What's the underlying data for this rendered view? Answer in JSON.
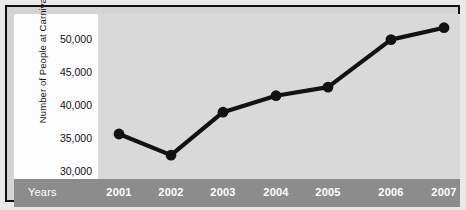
{
  "chart_data": {
    "type": "line",
    "title": "",
    "xlabel": "Years",
    "ylabel": "Number of People at Carnival",
    "categories": [
      "2001",
      "2002",
      "2003",
      "2004",
      "2005",
      "2006",
      "2007"
    ],
    "values": [
      34700,
      31500,
      38000,
      40500,
      41800,
      49000,
      50800
    ],
    "series": [
      {
        "name": "Number of People at Carnival",
        "values": [
          34700,
          31500,
          38000,
          40500,
          41800,
          49000,
          50800
        ]
      }
    ],
    "ylim": [
      28000,
      52000
    ],
    "yticks": [
      30000,
      35000,
      40000,
      45000,
      50000
    ],
    "ytick_labels": [
      "30,000",
      "35,000",
      "40,000",
      "45,000",
      "50,000"
    ],
    "grid": false,
    "legend": "none",
    "marker": "filled-circle",
    "line_color": "#121212",
    "marker_color": "#121212",
    "plot_background": "#d9d9d9",
    "axis_band_color": "#8c8c8c",
    "frame_color": "#111111"
  },
  "axis": {
    "y_title": "Number of People at Carnival",
    "x_title": "Years",
    "y_labels": [
      "50,000",
      "45,000",
      "40,000",
      "35,000",
      "30,000"
    ],
    "x_labels": [
      "2001",
      "2002",
      "2003",
      "2004",
      "2005",
      "2006",
      "2007"
    ]
  }
}
